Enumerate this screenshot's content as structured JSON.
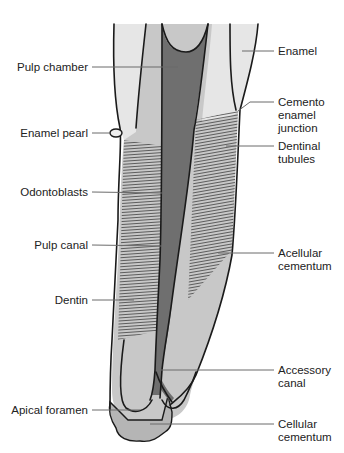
{
  "colors": {
    "background": "#ffffff",
    "enamel": "#e6e6e6",
    "dentin": "#c8c8c8",
    "pulp": "#6f6f6f",
    "cementum": "#b5b5b5",
    "outline": "#1a1a1a",
    "leader": "#6b6b6b",
    "text": "#222222"
  },
  "labels": {
    "left": [
      {
        "id": "pulp-chamber",
        "text": "Pulp chamber"
      },
      {
        "id": "enamel-pearl",
        "text": "Enamel pearl"
      },
      {
        "id": "odontoblasts",
        "text": "Odontoblasts"
      },
      {
        "id": "pulp-canal",
        "text": "Pulp canal"
      },
      {
        "id": "dentin",
        "text": "Dentin"
      },
      {
        "id": "apical-foramen",
        "text": "Apical foramen"
      }
    ],
    "right": [
      {
        "id": "enamel",
        "lines": [
          "Enamel"
        ]
      },
      {
        "id": "cemento-enamel-junction",
        "lines": [
          "Cemento",
          "enamel",
          "junction"
        ]
      },
      {
        "id": "dentinal-tubules",
        "lines": [
          "Dentinal",
          "tubules"
        ]
      },
      {
        "id": "acellular-cementum",
        "lines": [
          "Acellular",
          "cementum"
        ]
      },
      {
        "id": "accessory-canal",
        "lines": [
          "Accessory",
          "canal"
        ]
      },
      {
        "id": "cellular-cementum",
        "lines": [
          "Cellular",
          "cementum"
        ]
      }
    ]
  }
}
